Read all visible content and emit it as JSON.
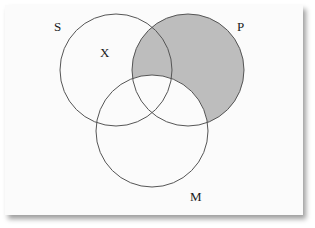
{
  "diagram": {
    "type": "venn",
    "sets": [
      {
        "id": "S",
        "label": "S",
        "cx": 116,
        "cy": 70,
        "r": 56,
        "label_x": 54,
        "label_y": 31
      },
      {
        "id": "P",
        "label": "P",
        "cx": 188,
        "cy": 70,
        "r": 56,
        "label_x": 237,
        "label_y": 31
      },
      {
        "id": "M",
        "label": "M",
        "cx": 152,
        "cy": 131,
        "r": 56,
        "label_x": 190,
        "label_y": 201
      }
    ],
    "marks": [
      {
        "label": "X",
        "x": 100,
        "y": 57
      }
    ],
    "shaded_region": "P minus M",
    "colors": {
      "shade": "#bdbdbd",
      "stroke": "#555555",
      "background": "#fbfbfb"
    }
  }
}
